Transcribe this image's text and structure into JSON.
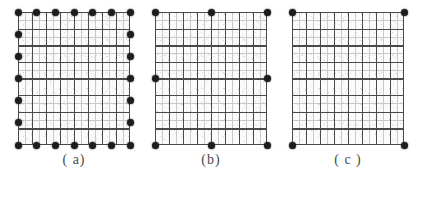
{
  "figure": {
    "title": "",
    "panels": [
      {
        "id": "a",
        "caption": "( a)",
        "left": 18,
        "description": "Mesh with nodes on all boundary edges",
        "grid": {
          "major_cols": 8,
          "major_rows": 8,
          "minor_per_major": 2
        },
        "nodes": [
          {
            "x": 0,
            "y": 0
          },
          {
            "x": 16.6,
            "y": 0
          },
          {
            "x": 33.3,
            "y": 0
          },
          {
            "x": 50,
            "y": 0
          },
          {
            "x": 66.6,
            "y": 0
          },
          {
            "x": 83.3,
            "y": 0
          },
          {
            "x": 100,
            "y": 0
          },
          {
            "x": 0,
            "y": 16.6
          },
          {
            "x": 0,
            "y": 33.3
          },
          {
            "x": 0,
            "y": 50
          },
          {
            "x": 0,
            "y": 66.6
          },
          {
            "x": 0,
            "y": 83.3
          },
          {
            "x": 0,
            "y": 100
          },
          {
            "x": 100,
            "y": 16.6
          },
          {
            "x": 100,
            "y": 33.3
          },
          {
            "x": 100,
            "y": 50
          },
          {
            "x": 100,
            "y": 66.6
          },
          {
            "x": 100,
            "y": 83.3
          },
          {
            "x": 100,
            "y": 100
          },
          {
            "x": 16.6,
            "y": 100
          },
          {
            "x": 33.3,
            "y": 100
          },
          {
            "x": 50,
            "y": 100
          },
          {
            "x": 66.6,
            "y": 100
          },
          {
            "x": 83.3,
            "y": 100
          }
        ]
      },
      {
        "id": "b",
        "caption": "(b)",
        "left": 155,
        "description": "Mesh with nodes at corners and edge midpoints",
        "grid": {
          "major_cols": 8,
          "major_rows": 8,
          "minor_per_major": 2
        },
        "nodes": [
          {
            "x": 0,
            "y": 0
          },
          {
            "x": 50,
            "y": 0
          },
          {
            "x": 100,
            "y": 0
          },
          {
            "x": 0,
            "y": 50
          },
          {
            "x": 100,
            "y": 50
          },
          {
            "x": 0,
            "y": 100
          },
          {
            "x": 50,
            "y": 100
          },
          {
            "x": 100,
            "y": 100
          }
        ]
      },
      {
        "id": "c",
        "caption": "( c )",
        "left": 292,
        "description": "Mesh with nodes at corners only",
        "grid": {
          "major_cols": 8,
          "major_rows": 8,
          "minor_per_major": 2
        },
        "nodes": [
          {
            "x": 0,
            "y": 0
          },
          {
            "x": 100,
            "y": 0
          },
          {
            "x": 0,
            "y": 100
          },
          {
            "x": 100,
            "y": 100
          }
        ]
      }
    ],
    "colors": {
      "node": "#1d1d1d",
      "major_line": "#4a4a4a",
      "minor_line": "#b9b9b9",
      "background": "#fbfbfa",
      "caption_text": "#4a4a4a"
    }
  }
}
